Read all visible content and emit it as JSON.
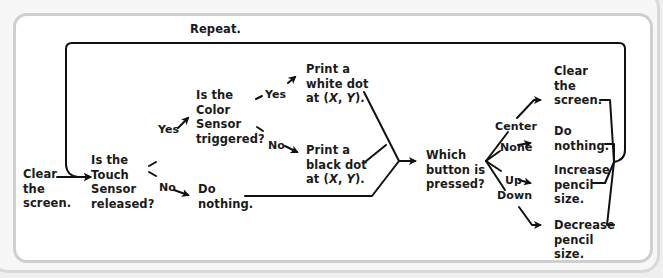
{
  "diagram": {
    "loop_label": "Repeat.",
    "nodes": {
      "start": "Clear\nthe\nscreen.",
      "touch_question": "Is the\nTouch\nSensor\nreleased?",
      "color_question": "Is the\nColor\nSensor\ntriggered?",
      "print_white": "Print a\nwhite dot\nat (X, Y).",
      "print_black": "Print a\nblack dot\nat (X, Y).",
      "do_nothing_1": "Do\nnothing.",
      "button_question": "Which\nbutton is\npressed?",
      "clear_screen": "Clear\nthe\nscreen.",
      "do_nothing_2": "Do\nnothing.",
      "increase_pencil": "Increase\npencil\nsize.",
      "decrease_pencil": "Decrease\npencil\nsize."
    },
    "edge_labels": {
      "touch_yes": "Yes",
      "touch_no": "No",
      "color_yes": "Yes",
      "color_no": "No",
      "btn_center": "Center",
      "btn_none": "None",
      "btn_up": "Up",
      "btn_down": "Down"
    },
    "colors": {
      "line": "#111111",
      "frame": "#cfcfcf",
      "background": "#ffffff"
    }
  }
}
